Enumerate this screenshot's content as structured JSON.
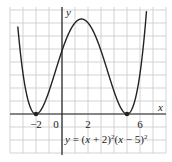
{
  "chart_data": {
    "type": "line",
    "title": "",
    "equation": "y = (x + 2)^2(x − 5)^2",
    "equation_label": {
      "prefix": "y = (x + 2)",
      "mid": "(x − 5)",
      "exp": "2"
    },
    "xlabel": "x",
    "ylabel": "y",
    "x_tick_labels": [
      "−2",
      "0",
      "2",
      "6"
    ],
    "x_ticks": [
      -2,
      0,
      2,
      6
    ],
    "xlim": [
      -4,
      7.8
    ],
    "ylim": [
      -60,
      165
    ],
    "grid": true,
    "series": [
      {
        "name": "y = (x+2)^2(x-5)^2",
        "x": [
          -3.3,
          -3,
          -2.5,
          -2,
          -1.5,
          -1,
          0,
          1,
          1.5,
          2,
          3,
          4,
          5,
          5.5,
          6,
          6.5
        ],
        "y": [
          473.2,
          64,
          15.1,
          0,
          10.6,
          36,
          100,
          144,
          150.1,
          144,
          100,
          36,
          0,
          14.1,
          64,
          182.3
        ]
      }
    ],
    "points": [
      {
        "x": -2,
        "y": 0,
        "label": "double root"
      },
      {
        "x": 5,
        "y": 0,
        "label": "double root"
      }
    ],
    "local_max": {
      "x": 1.5,
      "y": 150.06
    }
  }
}
